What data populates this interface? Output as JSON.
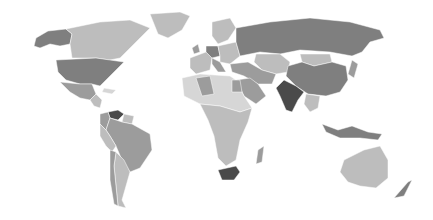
{
  "map": {
    "type": "choropleth",
    "projection": "world",
    "color_scheme": "grayscale",
    "legend": null,
    "shades": {
      "very_light": "#d6d6d6",
      "light": "#bdbdbd",
      "medium": "#9c9c9c",
      "dark": "#7f7f7f",
      "darkest": "#4a4a4a"
    },
    "regions": [
      {
        "name": "Alaska",
        "shade": "dark"
      },
      {
        "name": "Canada",
        "shade": "light"
      },
      {
        "name": "Greenland",
        "shade": "light"
      },
      {
        "name": "United States",
        "shade": "dark"
      },
      {
        "name": "Mexico",
        "shade": "medium"
      },
      {
        "name": "Central America",
        "shade": "light"
      },
      {
        "name": "Venezuela",
        "shade": "darkest"
      },
      {
        "name": "Colombia",
        "shade": "medium"
      },
      {
        "name": "Brazil",
        "shade": "medium"
      },
      {
        "name": "Peru",
        "shade": "light"
      },
      {
        "name": "Argentina",
        "shade": "light"
      },
      {
        "name": "Chile",
        "shade": "medium"
      },
      {
        "name": "Russia",
        "shade": "dark"
      },
      {
        "name": "Europe West",
        "shade": "light"
      },
      {
        "name": "Germany",
        "shade": "dark"
      },
      {
        "name": "Kazakhstan",
        "shade": "light"
      },
      {
        "name": "Mongolia",
        "shade": "light"
      },
      {
        "name": "China",
        "shade": "dark"
      },
      {
        "name": "India",
        "shade": "darkest"
      },
      {
        "name": "Middle East",
        "shade": "medium"
      },
      {
        "name": "Algeria",
        "shade": "medium"
      },
      {
        "name": "Egypt",
        "shade": "medium"
      },
      {
        "name": "Africa",
        "shade": "light"
      },
      {
        "name": "South Africa",
        "shade": "darkest"
      },
      {
        "name": "Madagascar",
        "shade": "medium"
      },
      {
        "name": "Southeast Asia",
        "shade": "light"
      },
      {
        "name": "Indonesia",
        "shade": "dark"
      },
      {
        "name": "Australia",
        "shade": "light"
      },
      {
        "name": "New Zealand",
        "shade": "dark"
      },
      {
        "name": "Japan",
        "shade": "medium"
      }
    ]
  }
}
